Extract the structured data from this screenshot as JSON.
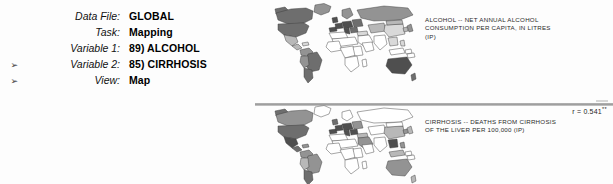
{
  "panel": {
    "rows": [
      {
        "marker": "",
        "label": "Data File:",
        "value": "GLOBAL"
      },
      {
        "marker": "",
        "label": "Task:",
        "value": "Mapping"
      },
      {
        "marker": "",
        "label": "Variable 1:",
        "value": "89) ALCOHOL"
      },
      {
        "marker": "➢",
        "label": "Variable 2:",
        "value": "85) CIRRHOSIS"
      },
      {
        "marker": "➢",
        "label": "View:",
        "value": "Map"
      }
    ]
  },
  "maps": [
    {
      "name": "alcohol-map",
      "caption_lines": [
        "ALCOHOL -- NET ANNUAL ALCOHOL",
        "CONSUMPTION PER CAPITA, IN LITRES",
        "(IP)"
      ]
    },
    {
      "name": "cirrhosis-map",
      "caption_lines": [
        "CIRRHOSIS -- DEATHS FROM CIRRHOSIS",
        "OF THE LIVER PER 100,000 (IP)",
        ""
      ]
    }
  ],
  "statistics": {
    "correlation_label": "r = ",
    "correlation_value": "0.541",
    "significance": "**"
  },
  "colors": {
    "shade_highest": "#4f4f4f",
    "shade_high": "#6e6e6e",
    "shade_medium": "#939393",
    "shade_low": "#b8b8b8",
    "shade_lowest": "#d9d9d9",
    "shade_none": "#ffffff",
    "outline": "#3a3a3a",
    "divider": "#9a9a9a"
  }
}
